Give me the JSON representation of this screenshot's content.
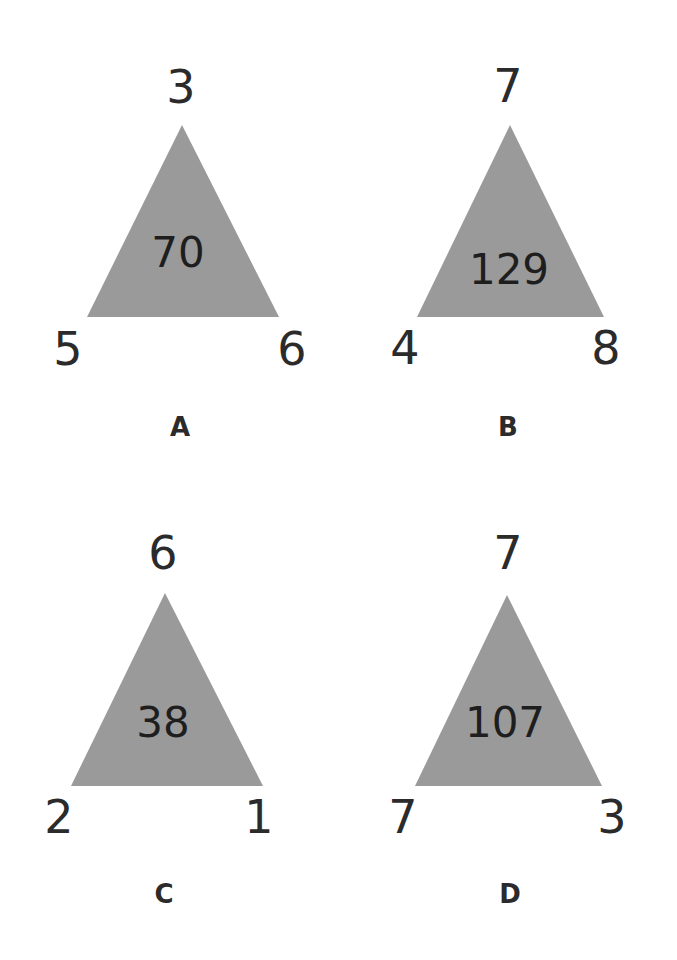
{
  "puzzle": {
    "triangle_color": "#9a9a9a",
    "triangles": [
      {
        "label": "A",
        "top": "3",
        "left": "5",
        "right": "6",
        "center": "70"
      },
      {
        "label": "B",
        "top": "7",
        "left": "4",
        "right": "8",
        "center": "129"
      },
      {
        "label": "C",
        "top": "6",
        "left": "2",
        "right": "1",
        "center": "38"
      },
      {
        "label": "D",
        "top": "7",
        "left": "7",
        "right": "3",
        "center": "107"
      }
    ]
  }
}
